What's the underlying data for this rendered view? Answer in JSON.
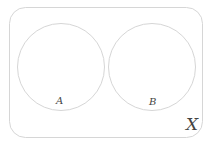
{
  "diagram": {
    "type": "venn",
    "universe": {
      "label": "X",
      "stroke": "#d6d6d6"
    },
    "sets": [
      {
        "label": "A",
        "stroke": "#d6d6d6"
      },
      {
        "label": "B",
        "stroke": "#d6d6d6"
      }
    ],
    "relationship": "disjoint"
  }
}
